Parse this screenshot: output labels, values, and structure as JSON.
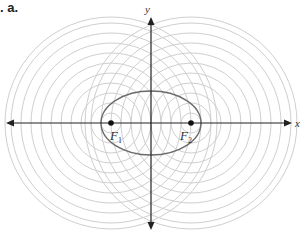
{
  "figure": {
    "part_label": ". a.",
    "x_axis_label": "x",
    "y_axis_label": "y",
    "foci": [
      {
        "name": "F",
        "subscript": "1",
        "cx": 111,
        "cy": 123
      },
      {
        "name": "F",
        "subscript": "2",
        "cx": 191,
        "cy": 123
      }
    ],
    "ellipse": {
      "cx": 151,
      "cy": 123,
      "rx": 50,
      "ry": 32
    },
    "circle_radii": [
      10,
      20,
      30,
      40,
      50,
      60,
      70,
      80,
      90,
      100,
      106
    ],
    "colors": {
      "circles": "#cfcfcf",
      "ellipse": "#6b6b6b",
      "axes": "#222222",
      "focus_dot": "#111111"
    }
  }
}
